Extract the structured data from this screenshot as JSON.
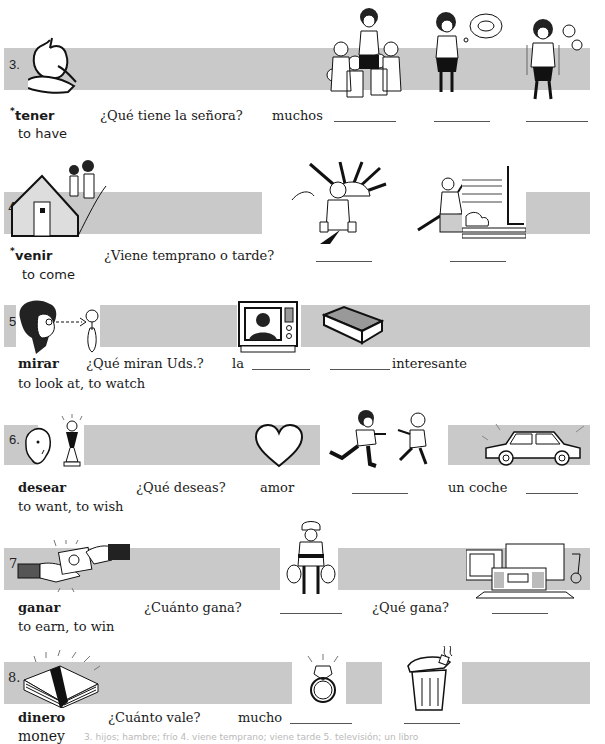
{
  "colors": {
    "band": "#c9c9c9",
    "text": "#1a1a1a",
    "footnote": "#b9b9b9"
  },
  "items": [
    {
      "number": "3.",
      "verb": "tener",
      "irregular_mark": "*",
      "gloss": "to have",
      "question": "¿Qué tiene la señora?",
      "answer_parts": [
        "muchos"
      ],
      "images": [
        "apple-in-hand",
        "mother-with-children",
        "hungry-woman",
        "cold-woman"
      ]
    },
    {
      "number": "4.",
      "verb": "venir",
      "irregular_mark": "*",
      "gloss": "to come",
      "question": "¿Viene temprano o tarde?",
      "answer_parts": [],
      "images": [
        "children-walking-to-house",
        "worker-at-sunrise",
        "man-running-late"
      ]
    },
    {
      "number": "5.",
      "verb": "mirar",
      "gloss": "to look at, to watch",
      "question": "¿Qué miran Uds.?",
      "answer_parts": [
        "la",
        "interesante"
      ],
      "images": [
        "woman-looking-at-flower",
        "television",
        "book"
      ]
    },
    {
      "number": "6.",
      "verb": "desear",
      "gloss": "to want, to wish",
      "question": "¿Qué deseas?",
      "answer_parts": [
        "amor",
        "un coche"
      ],
      "images": [
        "person-wishing-trophy",
        "heart",
        "friends-greeting",
        "car"
      ]
    },
    {
      "number": "7.",
      "verb": "ganar",
      "gloss": "to earn, to win",
      "question": "¿Cuánto gana?",
      "question2": "¿Qué gana?",
      "answer_parts": [],
      "images": [
        "hands-exchanging-money",
        "man-with-money-bags",
        "prizes-tv-sofa-radio"
      ]
    },
    {
      "number": "8.",
      "verb": "dinero",
      "gloss": "money",
      "question": "¿Cuánto vale?",
      "answer_parts": [
        "mucho"
      ],
      "images": [
        "stack-of-money",
        "diamond-ring",
        "trash-can"
      ]
    }
  ],
  "footnote": "3. hijos; hambre; frío   4. viene temprano; viene tarde   5. televisión; un libro"
}
